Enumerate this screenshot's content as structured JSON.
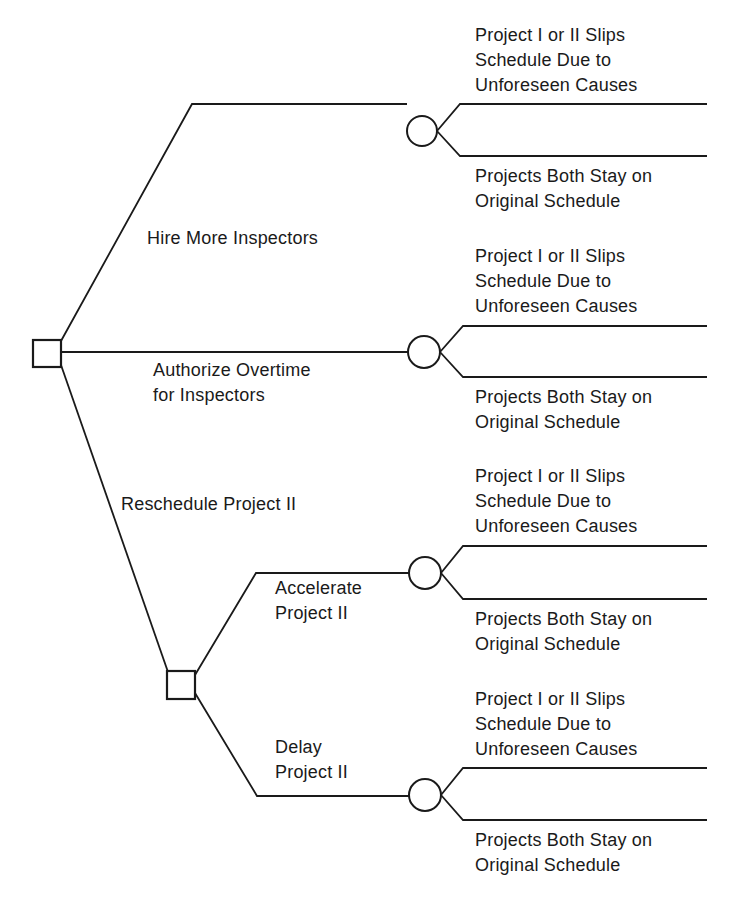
{
  "diagram": {
    "type": "decision-tree",
    "stroke_color": "#1a1a1a",
    "background": "#ffffff",
    "root": {
      "node_type": "decision",
      "shape": "square",
      "alternatives": [
        {
          "label_lines": [
            "Hire More Inspectors"
          ],
          "chance_node": {
            "shape": "circle",
            "outcomes": [
              {
                "label_lines": [
                  "Project I or II Slips",
                  "Schedule Due to",
                  "Unforeseen Causes"
                ]
              },
              {
                "label_lines": [
                  "Projects Both Stay on",
                  "Original Schedule"
                ]
              }
            ]
          }
        },
        {
          "label_lines": [
            "Authorize Overtime",
            "for Inspectors"
          ],
          "chance_node": {
            "shape": "circle",
            "outcomes": [
              {
                "label_lines": [
                  "Project I or II Slips",
                  "Schedule Due to",
                  "Unforeseen Causes"
                ]
              },
              {
                "label_lines": [
                  "Projects Both Stay on",
                  "Original Schedule"
                ]
              }
            ]
          }
        },
        {
          "label_lines": [
            "Reschedule Project II"
          ],
          "decision_node": {
            "shape": "square",
            "alternatives": [
              {
                "label_lines": [
                  "Accelerate",
                  "Project II"
                ],
                "chance_node": {
                  "shape": "circle",
                  "outcomes": [
                    {
                      "label_lines": [
                        "Project I or II Slips",
                        "Schedule Due to",
                        "Unforeseen Causes"
                      ]
                    },
                    {
                      "label_lines": [
                        "Projects Both Stay on",
                        "Original Schedule"
                      ]
                    }
                  ]
                }
              },
              {
                "label_lines": [
                  "Delay",
                  "Project II"
                ],
                "chance_node": {
                  "shape": "circle",
                  "outcomes": [
                    {
                      "label_lines": [
                        "Project I or II Slips",
                        "Schedule Due to",
                        "Unforeseen Causes"
                      ]
                    },
                    {
                      "label_lines": [
                        "Projects Both Stay on",
                        "Original Schedule"
                      ]
                    }
                  ]
                }
              }
            ]
          }
        }
      ]
    }
  }
}
